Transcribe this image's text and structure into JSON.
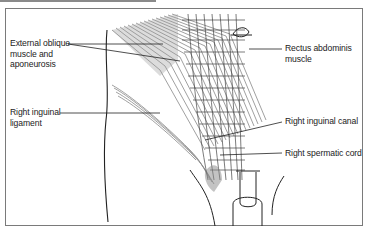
{
  "figure": {
    "labels": {
      "external_oblique": [
        "External oblique",
        "muscle and",
        "aponeurosis"
      ],
      "inguinal_ligament": [
        "Right inguinal",
        "ligament"
      ],
      "rectus_abdominis": [
        "Rectus abdominis",
        "muscle"
      ],
      "inguinal_canal": [
        "Right inguinal canal"
      ],
      "spermatic_cord": [
        "Right spermatic cord"
      ]
    },
    "colors": {
      "frame": "#7a7a7a",
      "line": "#222222",
      "muscle_fiber": "#6e6e6e",
      "text": "#222222"
    }
  }
}
